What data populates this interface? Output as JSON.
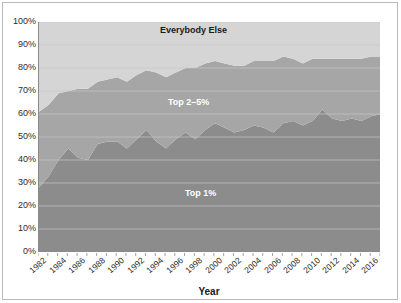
{
  "chart_data": {
    "type": "area",
    "title": "",
    "xlabel": "Year",
    "ylabel": "",
    "stacked": true,
    "grid": true,
    "legend_position": "in-plot-labels",
    "ylim": [
      0,
      100
    ],
    "ytick_labels": [
      "100%",
      "90%",
      "80%",
      "70%",
      "60%",
      "50%",
      "40%",
      "30%",
      "20%",
      "10%",
      "0%"
    ],
    "ytick_values": [
      100,
      90,
      80,
      70,
      60,
      50,
      40,
      30,
      20,
      10,
      0
    ],
    "xlim": [
      1982,
      2017
    ],
    "xtick_labels": [
      "1982",
      "1984",
      "1986",
      "1988",
      "1990",
      "1992",
      "1994",
      "1996",
      "1998",
      "2000",
      "2002",
      "2004",
      "2006",
      "2008",
      "2010",
      "2012",
      "2014",
      "2016"
    ],
    "xtick_values": [
      1982,
      1984,
      1986,
      1988,
      1990,
      1992,
      1994,
      1996,
      1998,
      2000,
      2002,
      2004,
      2006,
      2008,
      2010,
      2012,
      2014,
      2016
    ],
    "x": [
      1982,
      1983,
      1984,
      1985,
      1986,
      1987,
      1988,
      1989,
      1990,
      1991,
      1992,
      1993,
      1994,
      1995,
      1996,
      1997,
      1998,
      1999,
      2000,
      2001,
      2002,
      2003,
      2004,
      2005,
      2006,
      2007,
      2008,
      2009,
      2010,
      2011,
      2012,
      2013,
      2014,
      2015,
      2016,
      2017
    ],
    "series": [
      {
        "name": "Top 1%",
        "color": "#8c8c8c",
        "values": [
          28,
          33,
          40,
          45,
          41,
          40,
          47,
          48,
          48,
          45,
          49,
          53,
          48,
          45,
          49,
          52,
          49,
          53,
          56,
          54,
          52,
          53,
          55,
          54,
          52,
          56,
          57,
          55,
          57,
          62,
          58,
          57,
          58,
          57,
          59,
          60
        ]
      },
      {
        "name": "Top 2–5%",
        "color": "#a6a6a6",
        "values": [
          33,
          31,
          29,
          25,
          30,
          31,
          27,
          27,
          28,
          29,
          28,
          26,
          30,
          31,
          29,
          28,
          31,
          29,
          27,
          28,
          29,
          28,
          28,
          29,
          31,
          29,
          27,
          27,
          27,
          22,
          26,
          27,
          26,
          27,
          26,
          25
        ]
      },
      {
        "name": "Everybody Else",
        "color": "#d5d5d5",
        "values": [
          39,
          36,
          31,
          30,
          29,
          29,
          26,
          25,
          24,
          26,
          23,
          21,
          22,
          24,
          22,
          20,
          20,
          18,
          17,
          18,
          19,
          19,
          17,
          17,
          17,
          15,
          16,
          18,
          16,
          16,
          16,
          16,
          16,
          16,
          15,
          15
        ]
      }
    ],
    "annotations": [
      {
        "text": "Everybody Else",
        "series": "Everybody Else"
      },
      {
        "text": "Top 2–5%",
        "series": "Top 2–5%"
      },
      {
        "text": "Top 1%",
        "series": "Top 1%"
      }
    ],
    "colors": {
      "top_1": "#8c8c8c",
      "top_2_5": "#a6a6a6",
      "everybody_else": "#d5d5d5",
      "axis": "#8a8a8a",
      "gridline": "#c9c9c9",
      "frame": "#b9b9b9",
      "text": "#2b2b2b"
    }
  },
  "axis": {
    "x_title": "Year"
  },
  "labels": {
    "everybody_else": "Everybody Else",
    "top_2_5": "Top 2–5%",
    "top_1": "Top 1%"
  }
}
